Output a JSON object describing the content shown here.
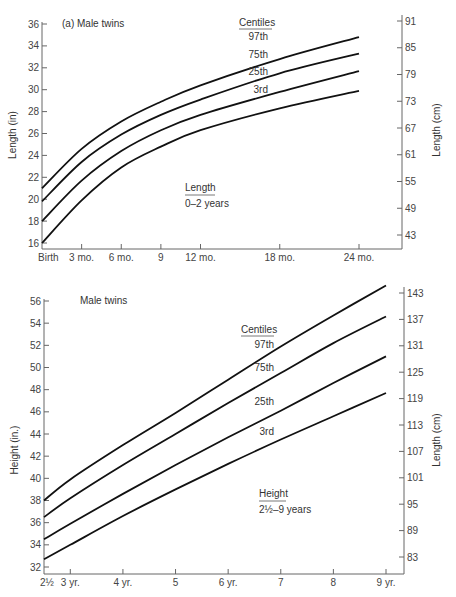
{
  "chart_data": [
    {
      "type": "line",
      "title": "(a) Male twins",
      "subtitle": "Length 0–2 years",
      "inset_label": {
        "title": "Length",
        "range": "0–2 years"
      },
      "legend_title": "Centiles",
      "xlabel": "",
      "ylabel": "Length (in)",
      "ylabel_right": "Length (cm)",
      "x_tick_labels": [
        "Birth",
        "3 mo.",
        "6 mo.",
        "9",
        "12 mo.",
        "18 mo.",
        "24 mo."
      ],
      "x_months": [
        0,
        3,
        6,
        9,
        12,
        18,
        24
      ],
      "y_ticks": [
        16,
        18,
        20,
        22,
        24,
        26,
        28,
        30,
        32,
        34,
        36
      ],
      "y_ticks_right": [
        43,
        49,
        55,
        61,
        67,
        73,
        79,
        85,
        91
      ],
      "ylim": [
        16,
        36
      ],
      "xlim": [
        0,
        24
      ],
      "grid": false,
      "series": [
        {
          "name": "97th",
          "values": [
            21.0,
            24.6,
            27.1,
            28.9,
            30.4,
            32.8,
            34.8
          ]
        },
        {
          "name": "75th",
          "values": [
            19.8,
            23.4,
            25.9,
            27.7,
            29.1,
            31.5,
            33.3
          ]
        },
        {
          "name": "25th",
          "values": [
            18.0,
            21.7,
            24.4,
            26.3,
            27.7,
            29.8,
            31.7
          ]
        },
        {
          "name": "3rd",
          "values": [
            16.0,
            19.9,
            22.9,
            24.8,
            26.3,
            28.3,
            29.9
          ]
        }
      ],
      "x_end_month": 22.5
    },
    {
      "type": "line",
      "title": "Male twins",
      "subtitle": "Height 2½–9 years",
      "inset_label": {
        "title": "Height",
        "range": "2½–9 years"
      },
      "legend_title": "Centiles",
      "xlabel": "",
      "ylabel": "Height (in.)",
      "ylabel_right": "Length (cm)",
      "x_tick_labels": [
        "2½",
        "3 yr.",
        "4 yr.",
        "5",
        "6 yr.",
        "7",
        "8",
        "9 yr."
      ],
      "x_years": [
        2.5,
        3,
        4,
        5,
        6,
        7,
        8,
        9
      ],
      "y_ticks": [
        32,
        34,
        36,
        38,
        40,
        42,
        44,
        46,
        48,
        50,
        52,
        54,
        56
      ],
      "y_ticks_right": [
        83,
        89,
        95,
        101,
        107,
        113,
        119,
        125,
        131,
        137,
        143
      ],
      "ylim": [
        32,
        56
      ],
      "xlim": [
        2.5,
        9
      ],
      "grid": false,
      "series": [
        {
          "name": "97th",
          "values": [
            38.0,
            39.9,
            43.0,
            45.9,
            48.9,
            51.9,
            54.7,
            57.4
          ]
        },
        {
          "name": "75th",
          "values": [
            36.5,
            38.2,
            41.2,
            44.0,
            46.8,
            49.5,
            52.2,
            54.6
          ]
        },
        {
          "name": "25th",
          "values": [
            34.5,
            35.9,
            38.6,
            41.2,
            43.7,
            46.1,
            48.6,
            51.0
          ]
        },
        {
          "name": "3rd",
          "values": [
            32.7,
            34.0,
            36.6,
            39.0,
            41.3,
            43.5,
            45.6,
            47.7
          ]
        }
      ]
    }
  ],
  "labels": {
    "top_title": "(a)  Male twins",
    "top_legend_title": "Centiles",
    "top_centiles": [
      "97th",
      "75th",
      "25th",
      "3rd"
    ],
    "top_inset_title": "Length",
    "top_inset_range": "0–2 years",
    "top_ylabel": "Length (in)",
    "top_ylabel_right": "Length (cm)",
    "bottom_title": "Male twins",
    "bottom_legend_title": "Centiles",
    "bottom_centiles": [
      "97th",
      "75th",
      "25th",
      "3rd"
    ],
    "bottom_inset_title": "Height",
    "bottom_inset_range": "2½–9 years",
    "bottom_ylabel": "Height (in.)",
    "bottom_ylabel_right": "Length (cm)"
  }
}
